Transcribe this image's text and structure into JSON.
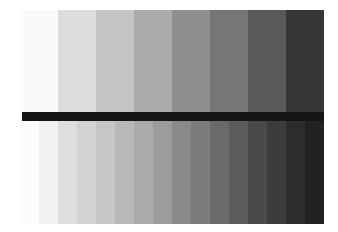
{
  "pattern": {
    "name": "grayscale step wedge test pattern",
    "top_bands": [
      "#fafafa",
      "#dcdcdc",
      "#c4c4c4",
      "#ababab",
      "#8f8f8f",
      "#767676",
      "#5a5a5a",
      "#363636"
    ],
    "bottom_bands": [
      "#fcfcfc",
      "#f2f2f2",
      "#dedede",
      "#d2d2d2",
      "#c6c6c6",
      "#b8b8b8",
      "#aaaaaa",
      "#9c9c9c",
      "#8a8a8a",
      "#7c7c7c",
      "#6a6a6a",
      "#5c5c5c",
      "#4a4a4a",
      "#3c3c3c",
      "#2c2c2c",
      "#222222"
    ],
    "bar_color": "#161616"
  }
}
